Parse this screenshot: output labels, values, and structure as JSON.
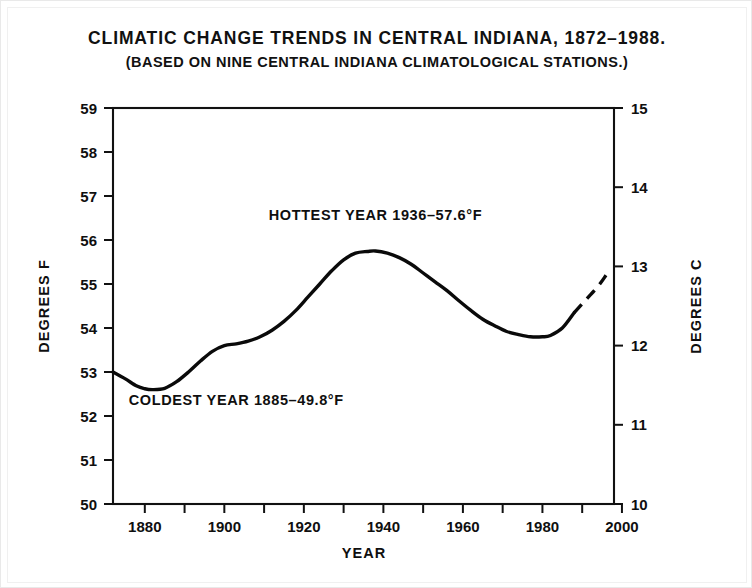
{
  "title": {
    "main": "CLIMATIC CHANGE TRENDS IN CENTRAL INDIANA, 1872–1988.",
    "sub": "(BASED ON NINE CENTRAL INDIANA CLIMATOLOGICAL STATIONS.)"
  },
  "chart_data": {
    "type": "line",
    "title": "CLIMATIC CHANGE TRENDS IN CENTRAL INDIANA, 1872–1988.",
    "subtitle": "(BASED ON NINE CENTRAL INDIANA CLIMATOLOGICAL STATIONS.)",
    "xlabel": "YEAR",
    "ylabel": "DEGREES F",
    "ylabel_right": "DEGREES C",
    "xlim": [
      1872,
      1998
    ],
    "ylim": [
      50,
      59
    ],
    "ylim_right": [
      10,
      15
    ],
    "grid": false,
    "legend": null,
    "x_ticks": [
      1880,
      1900,
      1920,
      1940,
      1960,
      1980,
      2000
    ],
    "x_ticks_minor": [
      1890,
      1910,
      1930,
      1950,
      1970,
      1990
    ],
    "x_tick_labels": [
      "1880",
      "1900",
      "1920",
      "1940",
      "1960",
      "1980",
      "2000"
    ],
    "y_ticks": [
      50,
      51,
      52,
      53,
      54,
      55,
      56,
      57,
      58,
      59
    ],
    "y_tick_labels": [
      "50",
      "51",
      "52",
      "53",
      "54",
      "55",
      "56",
      "57",
      "58",
      "59"
    ],
    "y_ticks_right": [
      10,
      11,
      12,
      13,
      14,
      15
    ],
    "y_tick_labels_right": [
      "10",
      "11",
      "12",
      "13",
      "14",
      "15"
    ],
    "series": [
      {
        "name": "Smoothed mean annual temperature (observed)",
        "style": "solid",
        "x": [
          1872,
          1875,
          1878,
          1880,
          1882,
          1885,
          1888,
          1891,
          1894,
          1897,
          1900,
          1903,
          1906,
          1909,
          1912,
          1915,
          1918,
          1921,
          1924,
          1927,
          1930,
          1933,
          1936,
          1938,
          1941,
          1944,
          1947,
          1950,
          1953,
          1956,
          1959,
          1962,
          1965,
          1968,
          1971,
          1974,
          1977,
          1980,
          1982,
          1985,
          1988
        ],
        "values": [
          53.0,
          52.85,
          52.68,
          52.62,
          52.6,
          52.63,
          52.78,
          53.0,
          53.25,
          53.47,
          53.6,
          53.64,
          53.7,
          53.8,
          53.95,
          54.15,
          54.4,
          54.7,
          55.0,
          55.3,
          55.55,
          55.7,
          55.74,
          55.75,
          55.7,
          55.6,
          55.45,
          55.25,
          55.05,
          54.85,
          54.62,
          54.4,
          54.2,
          54.05,
          53.92,
          53.85,
          53.8,
          53.8,
          53.83,
          54.0,
          54.35
        ]
      },
      {
        "name": "Projected trend",
        "style": "dashed",
        "x": [
          1988,
          1991,
          1994,
          1996
        ],
        "values": [
          54.35,
          54.65,
          54.95,
          55.2
        ]
      }
    ],
    "annotations": [
      {
        "text": "HOTTEST YEAR  1936–57.6°F",
        "x": 1938,
        "y": 56.45,
        "anchor": "middle"
      },
      {
        "text": "COLDEST YEAR  1885–49.8°F",
        "x": 1903,
        "y": 52.25,
        "anchor": "middle"
      }
    ],
    "colors": {
      "line": "#0a0a0a",
      "axis": "#111111",
      "background": "#ffffff",
      "text": "#0f0f0f"
    }
  },
  "axes": {
    "y_left_title": "DEGREES F",
    "y_right_title": "DEGREES C",
    "x_title": "YEAR"
  },
  "annotations": {
    "hottest": "HOTTEST YEAR  1936–57.6°F",
    "coldest": "COLDEST YEAR  1885–49.8°F"
  }
}
